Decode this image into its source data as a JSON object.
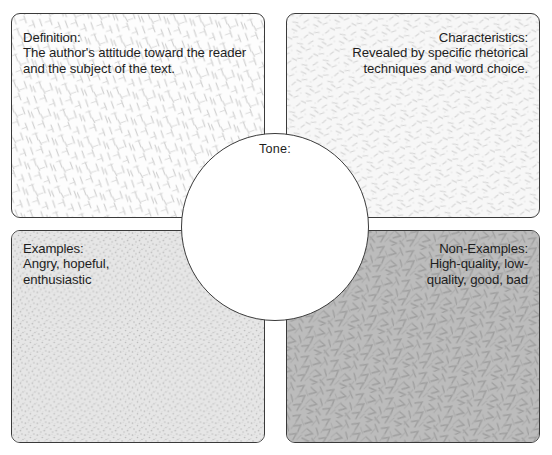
{
  "diagram": {
    "type": "frayer-model",
    "center": {
      "label": "Tone:",
      "value": ""
    },
    "quadrants": [
      {
        "key": "definition",
        "heading": "Definition:",
        "body": "The author's attitude toward the reader and the subject of the text.",
        "text": "Definition:\nThe author's attitude toward the reader\nand the subject of the text.",
        "align": "left",
        "position": "top-left",
        "fill": "#fdfdfd",
        "pattern": "fine-diagonal-dashes"
      },
      {
        "key": "characteristics",
        "heading": "Characteristics:",
        "body": "Revealed by specific rhetorical techniques and word choice.",
        "text": "Characteristics:\nRevealed by specific rhetorical\ntechniques and word choice.",
        "align": "right",
        "position": "top-right",
        "fill": "#f7f7f7",
        "pattern": "light-speckle-dashes"
      },
      {
        "key": "examples",
        "heading": "Examples:",
        "body": "Angry, hopeful, enthusiastic",
        "text": "Examples:\nAngry, hopeful,\nenthusiastic",
        "align": "left",
        "position": "bottom-left",
        "fill": "#e3e3e3",
        "pattern": "fine-stipple-dots"
      },
      {
        "key": "non-examples",
        "heading": "Non-Examples:",
        "body": "High-quality, low-quality, good, bad",
        "text": "Non-Examples:\nHigh-quality, low-\nquality, good, bad",
        "align": "right",
        "position": "bottom-right",
        "fill": "#bcbcbc",
        "pattern": "angular-strokes"
      }
    ],
    "colors": {
      "border": "#3a3a3a",
      "text": "#1d1d1d",
      "page_background": "#ffffff"
    }
  }
}
